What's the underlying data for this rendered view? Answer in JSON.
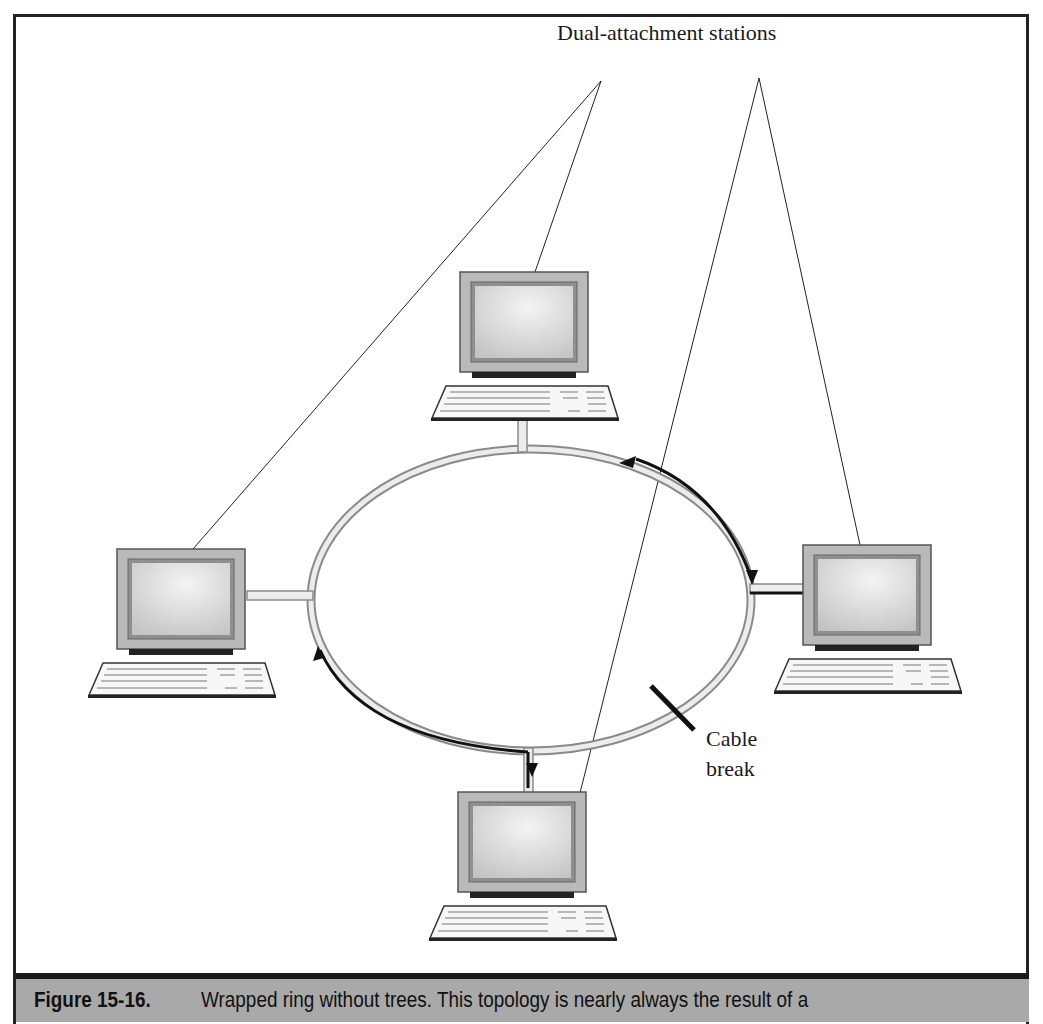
{
  "figure": {
    "number": "Figure 15-16.",
    "caption": "Wrapped ring without trees. This topology is nearly always the result of a"
  },
  "labels": {
    "stations": "Dual-attachment stations",
    "cable_break_line1": "Cable",
    "cable_break_line2": "break"
  },
  "stations": [
    {
      "name": "top-station",
      "position": "top"
    },
    {
      "name": "left-station",
      "position": "left"
    },
    {
      "name": "right-station",
      "position": "right"
    },
    {
      "name": "bottom-station",
      "position": "bottom"
    }
  ],
  "colors": {
    "caption_bg": "#a9a9a9",
    "monitor_bezel": "#b8b8b8",
    "monitor_screen": "#d4d4d4",
    "ring": "#e6e6e6",
    "ink": "#1a1a1a"
  }
}
